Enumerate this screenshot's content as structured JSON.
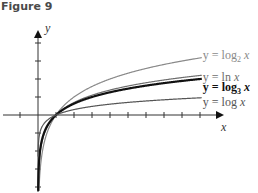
{
  "figure": {
    "title": "Figure 9"
  },
  "chart_data": {
    "type": "line",
    "title": "Figure 9",
    "xlabel": "x",
    "ylabel": "y",
    "grid": false,
    "series": [
      {
        "name": "y = log₂ x",
        "label_prefix": "y = log",
        "label_sub": "2",
        "label_suffix": " x",
        "base": 2,
        "color": "#8a8a8a",
        "weight": 1.2
      },
      {
        "name": "y = ln x",
        "label_prefix": "y = ln",
        "label_sub": "",
        "label_suffix": " x",
        "base": 2.718281828,
        "color": "#6e6e6e",
        "weight": 1.2
      },
      {
        "name": "y = log₃ x",
        "label_prefix": "y = log",
        "label_sub": "3",
        "label_suffix": " x",
        "base": 3,
        "color": "#111111",
        "weight": 2.2
      },
      {
        "name": "y = log x",
        "label_prefix": "y = log",
        "label_sub": "",
        "label_suffix": " x",
        "base": 10,
        "color": "#555555",
        "weight": 1.2
      }
    ],
    "x_ticks": [
      -1,
      1,
      2,
      3,
      4,
      5,
      6,
      7,
      8,
      9
    ],
    "y_ticks": [
      -4,
      -3,
      -2,
      -1,
      1,
      2,
      3,
      4
    ],
    "xlim": [
      -2,
      10
    ],
    "ylim": [
      -4,
      4.5
    ]
  }
}
